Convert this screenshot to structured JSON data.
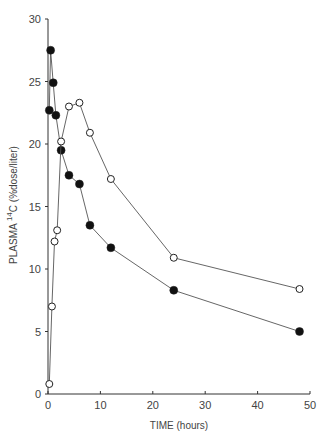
{
  "chart_data": {
    "type": "line",
    "title": "",
    "xlabel": "TIME (hours)",
    "ylabel_main": "PLASMA ",
    "ylabel_sup": "14",
    "ylabel_rest": "C (%dose/liter)",
    "ylabel": "PLASMA 14C (%dose/liter)",
    "xlim": [
      0,
      50
    ],
    "ylim": [
      0,
      30
    ],
    "xticks": [
      0,
      10,
      20,
      30,
      40,
      50
    ],
    "yticks": [
      0,
      5,
      10,
      15,
      20,
      25,
      30
    ],
    "grid": false,
    "legend": "none",
    "series": [
      {
        "name": "filled circles",
        "marker": "filled-circle",
        "x": [
          0.25,
          0.5,
          1,
          1.5,
          2.5,
          4,
          6,
          8,
          12,
          24,
          48
        ],
        "y": [
          22.7,
          27.5,
          24.9,
          22.3,
          19.5,
          17.5,
          16.8,
          13.5,
          11.7,
          8.3,
          5.0
        ]
      },
      {
        "name": "open circles",
        "marker": "open-circle",
        "x": [
          0.25,
          0.75,
          1.25,
          1.75,
          2.5,
          4,
          6,
          8,
          12,
          24,
          48
        ],
        "y": [
          0.8,
          7.0,
          12.2,
          13.1,
          20.2,
          23.0,
          23.3,
          20.9,
          17.2,
          10.9,
          8.4
        ]
      }
    ]
  }
}
